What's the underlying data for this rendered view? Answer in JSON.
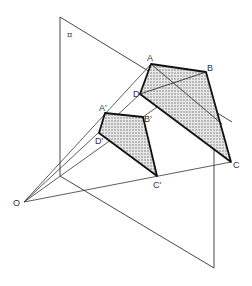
{
  "diagram": {
    "labels": {
      "plane": "π",
      "origin": "O",
      "A": "A",
      "B": "B",
      "C": "C",
      "D": "D",
      "A_prime": "A'",
      "B_prime": "B'",
      "C_prime": "C'",
      "D_prime": "D'"
    },
    "colors": {
      "line": "#222222",
      "thin_line": "#333333",
      "shade": "#bdbdbd",
      "background": "#ffffff"
    }
  }
}
